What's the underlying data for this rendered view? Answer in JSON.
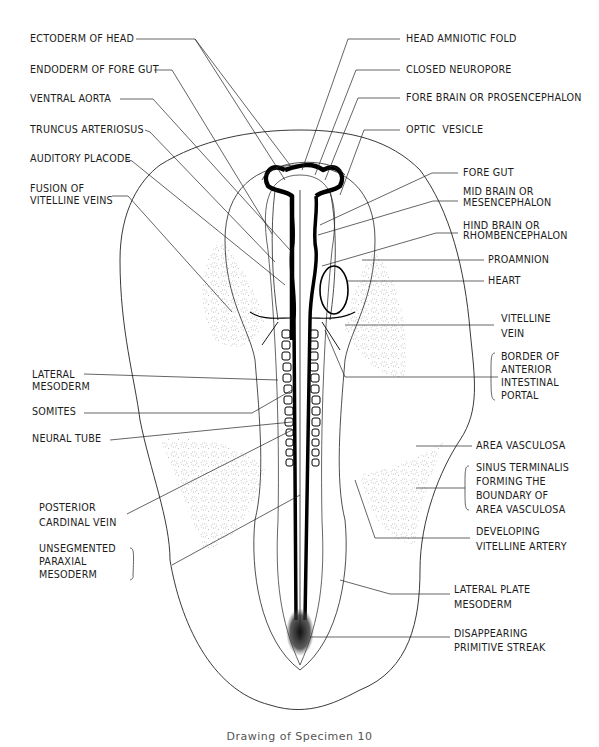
{
  "figure": {
    "caption": "Drawing of Specimen 10",
    "left_labels": [
      {
        "id": "ectoderm-of-head",
        "text": "ECTODERM OF HEAD",
        "x": 30,
        "y": 33
      },
      {
        "id": "endoderm-of-fore-gut",
        "text": "ENDODERM OF FORE GUT",
        "x": 30,
        "y": 64
      },
      {
        "id": "ventral-aorta",
        "text": "VENTRAL AORTA",
        "x": 30,
        "y": 93
      },
      {
        "id": "truncus-arteriosus",
        "text": "TRUNCUS ARTERIOSUS",
        "x": 30,
        "y": 124
      },
      {
        "id": "auditory-placode",
        "text": "AUDITORY PLACODE",
        "x": 30,
        "y": 153
      },
      {
        "id": "fusion-of-vitelline-veins",
        "text": "FUSION OF\nVITELLINE VEINS",
        "x": 30,
        "y": 183
      },
      {
        "id": "lateral-mesoderm",
        "text": "LATERAL\nMESODERM",
        "x": 32,
        "y": 369
      },
      {
        "id": "somites",
        "text": "SOMITES",
        "x": 32,
        "y": 406
      },
      {
        "id": "neural-tube",
        "text": "NEURAL TUBE",
        "x": 32,
        "y": 433
      },
      {
        "id": "posterior-cardinal-vein",
        "text": "POSTERIOR\nCARDINAL VEIN",
        "x": 39,
        "y": 500
      },
      {
        "id": "unsegmented-paraxial-mesoderm",
        "text": "UNSEGMENTED\nPARAXIAL\nMESODERM",
        "x": 39,
        "y": 542
      }
    ],
    "right_labels": [
      {
        "id": "head-amniotic-fold",
        "text": "HEAD AMNIOTIC FOLD",
        "x": 406,
        "y": 33
      },
      {
        "id": "closed-neuropore",
        "text": "CLOSED NEUROPORE",
        "x": 406,
        "y": 64
      },
      {
        "id": "fore-brain",
        "text": "FORE BRAIN OR PROSENCEPHALON",
        "x": 406,
        "y": 92
      },
      {
        "id": "optic-vesicle",
        "text": "OPTIC  VESICLE",
        "x": 406,
        "y": 124
      },
      {
        "id": "fore-gut",
        "text": "FORE GUT",
        "x": 463,
        "y": 167
      },
      {
        "id": "mid-brain",
        "text": "MID BRAIN OR\nMESENCEPHALON",
        "x": 463,
        "y": 186
      },
      {
        "id": "hind-brain",
        "text": "HIND BRAIN OR\nRHOMBENCEPHALON",
        "x": 463,
        "y": 221
      },
      {
        "id": "proamnion",
        "text": "PROAMNION",
        "x": 488,
        "y": 254
      },
      {
        "id": "heart",
        "text": "HEART",
        "x": 488,
        "y": 275
      },
      {
        "id": "vitelline-vein",
        "text": "VITELLINE\nVEIN",
        "x": 501,
        "y": 311
      },
      {
        "id": "border-anterior-intestinal-portal",
        "text": "BORDER OF\nANTERIOR\nINTESTINAL\nPORTAL",
        "x": 501,
        "y": 350
      },
      {
        "id": "area-vasculosa",
        "text": "AREA VASCULOSA",
        "x": 476,
        "y": 440
      },
      {
        "id": "sinus-terminalis",
        "text": "SINUS TERMINALIS\nFORMING THE\nBOUNDARY OF\nAREA VASCULOSA",
        "x": 476,
        "y": 461
      },
      {
        "id": "developing-vitelline-artery",
        "text": "DEVELOPING\nVITELLINE ARTERY",
        "x": 476,
        "y": 524
      },
      {
        "id": "lateral-plate-mesoderm",
        "text": "LATERAL PLATE\nMESODERM",
        "x": 454,
        "y": 582
      },
      {
        "id": "disappearing-primitive-streak",
        "text": "DISAPPEARING\nPRIMITIVE STREAK",
        "x": 454,
        "y": 627
      }
    ]
  }
}
